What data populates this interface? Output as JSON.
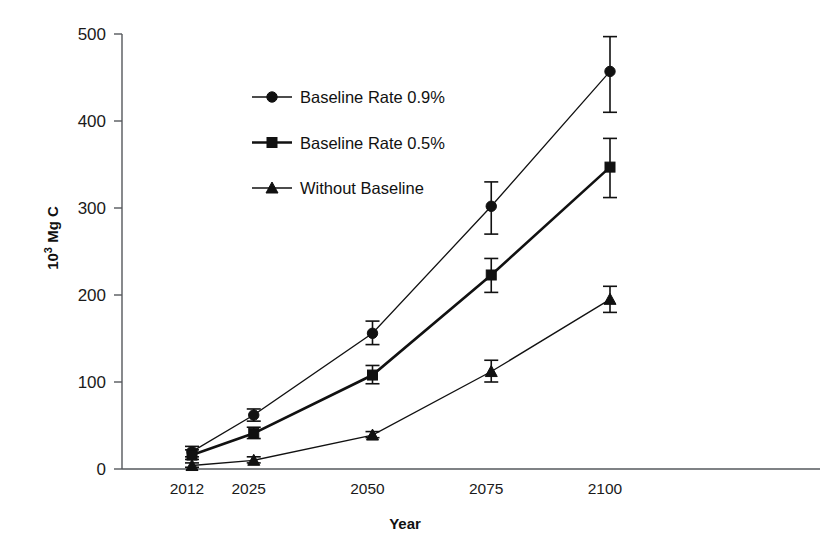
{
  "chart_data": {
    "type": "line",
    "title": "",
    "xlabel": "Year",
    "ylabel": "10³ Mg C",
    "ylabel_base": "10",
    "ylabel_exp": "3",
    "ylabel_unit": " Mg C",
    "categories": [
      "2012",
      "2025",
      "2050",
      "2075",
      "2100"
    ],
    "x": [
      2012,
      2025,
      2050,
      2075,
      2100
    ],
    "xlim": [
      2012,
      2100
    ],
    "ylim": [
      0,
      500
    ],
    "yticks": [
      0,
      100,
      200,
      300,
      400,
      500
    ],
    "ytick_labels": [
      "0",
      "100",
      "200",
      "300",
      "400",
      "500"
    ],
    "grid": false,
    "legend_position": "upper-left-inside",
    "series": [
      {
        "name": "Baseline Rate 0.9%",
        "marker": "circle",
        "line_weight": "thin",
        "values": [
          20,
          62,
          156,
          302,
          457
        ],
        "err_low": [
          14,
          55,
          143,
          270,
          410
        ],
        "err_high": [
          26,
          69,
          170,
          330,
          497
        ]
      },
      {
        "name": "Baseline Rate 0.5%",
        "marker": "square",
        "line_weight": "thick",
        "values": [
          16,
          41,
          108,
          223,
          347
        ],
        "err_low": [
          11,
          35,
          98,
          203,
          312
        ],
        "err_high": [
          22,
          48,
          119,
          242,
          380
        ]
      },
      {
        "name": "Without Baseline",
        "marker": "triangle",
        "line_weight": "thin",
        "values": [
          4,
          10,
          39,
          112,
          195
        ],
        "err_low": [
          2,
          7,
          36,
          100,
          180
        ],
        "err_high": [
          7,
          14,
          43,
          125,
          210
        ]
      }
    ],
    "colors": {
      "series": "#111111",
      "axis": "#55585c",
      "background": "#ffffff"
    }
  }
}
